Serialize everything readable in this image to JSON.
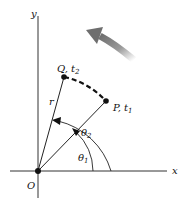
{
  "axes": {
    "x_label": "x",
    "y_label": "y",
    "origin_label": "O"
  },
  "points": {
    "Q": {
      "name": "Q",
      "time": "t",
      "time_sub": "2"
    },
    "P": {
      "name": "P",
      "time": "t",
      "time_sub": "1"
    }
  },
  "radius_label": "r",
  "angles": {
    "theta1": {
      "symbol": "θ",
      "sub": "1"
    },
    "theta2": {
      "symbol": "θ",
      "sub": "2"
    }
  },
  "colors": {
    "line": "#222222",
    "arrow": "#777777",
    "dashed_arc": "#111111"
  }
}
